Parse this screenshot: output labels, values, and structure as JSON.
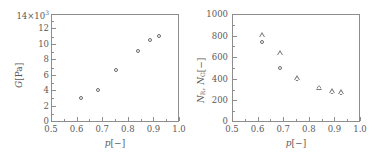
{
  "figure": {
    "background": "#ffffff",
    "axis_color": "#8d8d8d",
    "marker_color": "#6b6b6b",
    "text_color": "#5a5a5a"
  },
  "panels": [
    {
      "id": "left",
      "xlabel": "p[−]",
      "ylabel": "G[Pa]",
      "y_exponent_label": "14×10³",
      "xticks": [
        "0.5",
        "0.6",
        "0.7",
        "0.8",
        "0.9",
        "1.0"
      ],
      "yticks": [
        "0",
        "2",
        "4",
        "6",
        "8",
        "10",
        "12"
      ],
      "ytop_tick": "14"
    },
    {
      "id": "right",
      "xlabel": "p[−]",
      "ylabel": "N_R, N_G[−]",
      "ylabel_parts": {
        "n1": "N",
        "n1sub": "R",
        "sep": ", ",
        "n2": "N",
        "n2sub": "G",
        "unit": "[−]"
      },
      "xticks": [
        "0.5",
        "0.6",
        "0.7",
        "0.8",
        "0.9",
        "1.0"
      ],
      "yticks": [
        "0",
        "200",
        "400",
        "600",
        "800",
        "1000"
      ]
    }
  ],
  "chart_data": [
    {
      "type": "scatter",
      "panel": "left",
      "title": "",
      "xlabel": "p[-]",
      "ylabel": "G[Pa]",
      "y_scale_factor": 1000,
      "y_exponent_text": "14x10^3",
      "xlim": [
        0.5,
        1.0
      ],
      "ylim": [
        0,
        14
      ],
      "xticks": [
        0.5,
        0.6,
        0.7,
        0.8,
        0.9,
        1.0
      ],
      "yticks": [
        0,
        2,
        4,
        6,
        8,
        10,
        12,
        14
      ],
      "grid": false,
      "legend": "none",
      "series": [
        {
          "name": "G",
          "marker": "circle-open",
          "x": [
            0.617,
            0.683,
            0.752,
            0.838,
            0.888,
            0.923
          ],
          "y": [
            3.1,
            4.1,
            6.8,
            9.2,
            10.6,
            11.2
          ]
        }
      ]
    },
    {
      "type": "scatter",
      "panel": "right",
      "title": "",
      "xlabel": "p[-]",
      "ylabel": "N_R, N_G[-]",
      "xlim": [
        0.5,
        1.0
      ],
      "ylim": [
        0,
        1000
      ],
      "xticks": [
        0.5,
        0.6,
        0.7,
        0.8,
        0.9,
        1.0
      ],
      "yticks": [
        0,
        200,
        400,
        600,
        800,
        1000
      ],
      "grid": false,
      "legend": "none",
      "series": [
        {
          "name": "N_R",
          "marker": "circle-open",
          "x": [
            0.619,
            0.686,
            0.754,
            0.84,
            0.89,
            0.925
          ],
          "y": [
            740,
            500,
            398,
            318,
            280,
            268
          ]
        },
        {
          "name": "N_G",
          "marker": "triangle-open",
          "x": [
            0.619,
            0.686,
            0.754,
            0.84,
            0.89,
            0.925
          ],
          "y": [
            810,
            640,
            408,
            322,
            288,
            278
          ]
        }
      ]
    }
  ]
}
